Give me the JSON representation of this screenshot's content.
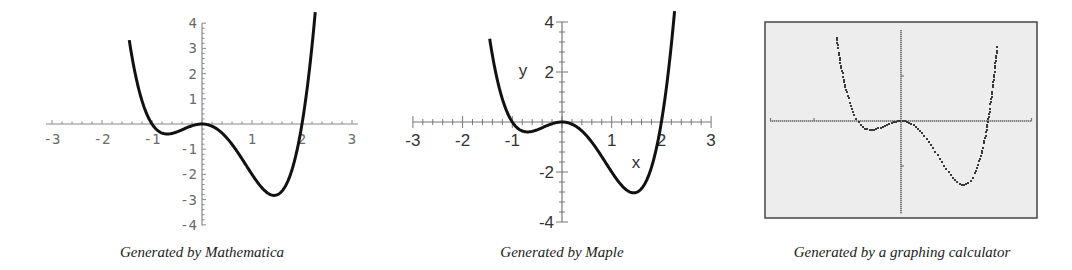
{
  "captions": {
    "mathematica": "Generated by Mathematica",
    "maple": "Generated by Maple",
    "calculator": "Generated by a graphing calculator"
  },
  "labels": {
    "maple_x_axis": "x",
    "maple_y_axis": "y"
  },
  "colors": {
    "curve": "#111111",
    "axis_mathematica": "#8a8a8a",
    "axis_maple": "#777777",
    "calculator_screen": "#ededed",
    "calculator_frame": "#444444"
  },
  "chart_data": [
    {
      "type": "line",
      "title": "Generated by Mathematica",
      "function": "y = x^4 - x^3 - 2x^2",
      "x": [
        -1.45,
        -1.2,
        -1.0,
        -0.8,
        -0.6,
        -0.4,
        -0.2,
        0,
        0.2,
        0.4,
        0.6,
        0.8,
        1.0,
        1.2,
        1.4,
        1.6,
        1.8,
        2.0,
        2.2,
        2.27
      ],
      "y": [
        4.0,
        1.82,
        0,
        -0.36,
        -0.37,
        -0.22,
        -0.07,
        0,
        -0.08,
        -0.36,
        -0.81,
        -1.35,
        -2.0,
        -2.53,
        -2.82,
        -2.66,
        -1.75,
        0,
        2.9,
        4.0
      ],
      "xlabel": "",
      "ylabel": "",
      "xticks": [
        "-3",
        "-2",
        "-1",
        "1",
        "2",
        "3"
      ],
      "yticks": [
        "4",
        "3",
        "2",
        "1",
        "-1",
        "-2",
        "-3",
        "-4"
      ],
      "xlim": [
        -3,
        3
      ],
      "ylim": [
        -4,
        4
      ],
      "grid": false
    },
    {
      "type": "line",
      "title": "Generated by Maple",
      "function": "y = x^4 - x^3 - 2x^2",
      "x": [
        -1.45,
        -1.2,
        -1.0,
        -0.8,
        -0.6,
        -0.4,
        -0.2,
        0,
        0.2,
        0.4,
        0.6,
        0.8,
        1.0,
        1.2,
        1.4,
        1.6,
        1.8,
        2.0,
        2.2,
        2.27
      ],
      "y": [
        4.0,
        1.82,
        0,
        -0.36,
        -0.37,
        -0.22,
        -0.07,
        0,
        -0.08,
        -0.36,
        -0.81,
        -1.35,
        -2.0,
        -2.53,
        -2.82,
        -2.66,
        -1.75,
        0,
        2.9,
        4.0
      ],
      "xlabel": "x",
      "ylabel": "y",
      "xticks": [
        "-3",
        "-2",
        "-1",
        "1",
        "2",
        "3"
      ],
      "yticks": [
        "4",
        "2",
        "-2",
        "-4"
      ],
      "xlim": [
        -3,
        3
      ],
      "ylim": [
        -4,
        4
      ],
      "grid": false
    },
    {
      "type": "scatter",
      "title": "Generated by a graphing calculator",
      "function": "y = x^4 - x^3 - 2x^2",
      "xlabel": "",
      "ylabel": "",
      "xticks": [],
      "yticks": [],
      "xlim": [
        -3,
        3
      ],
      "ylim": [
        -4,
        4
      ],
      "grid": false
    }
  ]
}
